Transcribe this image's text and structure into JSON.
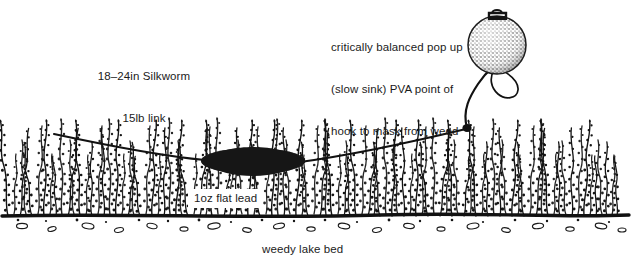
{
  "diagram": {
    "background_color": "#ffffff",
    "ink_color": "#1a1a1a",
    "labels": {
      "silkworm": {
        "line1": "18–24in Silkworm",
        "line2": "15lb link"
      },
      "popup": {
        "line1": "critically balanced pop up",
        "line2": "(slow sink) PVA point of",
        "line3": "hook to mask from weed"
      },
      "lead": "1oz flat lead",
      "lakebed": "weedy lake bed"
    },
    "elements": {
      "popup_bait": "pop-up-boilie",
      "hook": "hook",
      "lead_weight": "flat-lead-weight",
      "mainline": "mainline",
      "hooklink": "hook-link",
      "swivel": "swivel-knot",
      "weed": "weed-bed",
      "lakebed": "lake-bed-silt",
      "pebbles": "pebbles"
    }
  }
}
